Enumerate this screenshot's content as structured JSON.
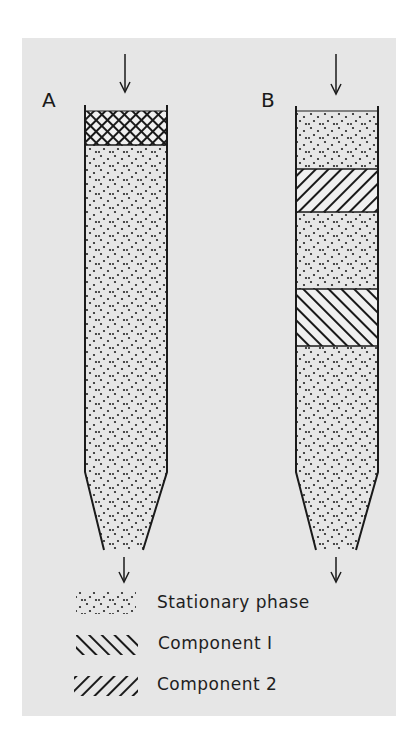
{
  "figure": {
    "type": "chromatography column schematic",
    "colors": {
      "background": "#e6e6e6",
      "ink": "#1a1a1a"
    }
  },
  "columns": [
    {
      "label": "A",
      "description": "Sample mixture loaded at top of column (cross-hatched band)",
      "bands": [
        "mixture",
        "stationary phase"
      ]
    },
    {
      "label": "B",
      "description": "Components separated into bands as mobile phase flows down",
      "bands": [
        "stationary phase",
        "Component 2",
        "stationary phase",
        "Component 1",
        "stationary phase"
      ]
    }
  ],
  "legend": {
    "items": [
      {
        "pattern": "dots",
        "label": "Stationary phase"
      },
      {
        "pattern": "backslash-hatch",
        "label": "Component I"
      },
      {
        "pattern": "slash-hatch",
        "label": "Component 2"
      }
    ]
  }
}
